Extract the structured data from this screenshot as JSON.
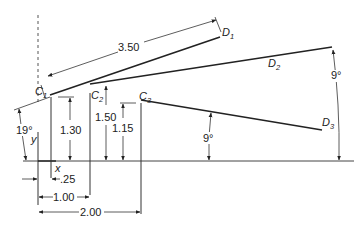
{
  "diagram": {
    "type": "engineering-dimension-drawing",
    "points": {
      "C1": {
        "label": "C",
        "sub": "1"
      },
      "C2": {
        "label": "C",
        "sub": "2"
      },
      "C3": {
        "label": "C",
        "sub": "3"
      },
      "D1": {
        "label": "D",
        "sub": "1"
      },
      "D2": {
        "label": "D",
        "sub": "2"
      },
      "D3": {
        "label": "D",
        "sub": "3"
      }
    },
    "axes": {
      "x": "x",
      "y": "y"
    },
    "dimensions": {
      "c1d1_length": "3.50",
      "c1_height": "1.30",
      "c2_height": "1.50",
      "c3_height": "1.15",
      "c1_x_offset": ".25",
      "c2_x_offset": "1.00",
      "c3_x_offset": "2.00",
      "angle_c1d1": "19°",
      "angle_c2d2": "9°",
      "angle_c3d3": "9°"
    },
    "colors": {
      "line": "#222222",
      "background": "#ffffff"
    }
  }
}
